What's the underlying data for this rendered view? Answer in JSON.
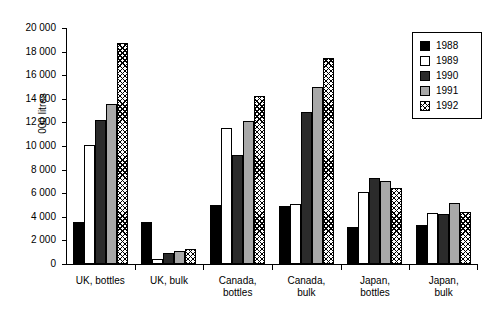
{
  "chart_data": {
    "type": "bar",
    "title": "",
    "xlabel": "",
    "ylabel": "000 litres",
    "ylim": [
      0,
      20000
    ],
    "ytick_labels": [
      "20 000",
      "18 000",
      "16 000",
      "14 000",
      "12 000",
      "10 000",
      "8 000",
      "6 000",
      "4 000",
      "2 000",
      "0"
    ],
    "ytick_values": [
      20000,
      18000,
      16000,
      14000,
      12000,
      10000,
      8000,
      6000,
      4000,
      2000,
      0
    ],
    "grid": false,
    "legend_position": "top-right",
    "categories": [
      "UK, bottles",
      "UK, bulk",
      "Canada,\nbottles",
      "Canada,\nbulk",
      "Japan,\nbottles",
      "Japan,\nbulk"
    ],
    "series": [
      {
        "name": "1988",
        "color": "#000000",
        "pattern": "solid-black",
        "values": [
          3600,
          3600,
          5000,
          4900,
          3100,
          3300
        ]
      },
      {
        "name": "1989",
        "color": "#ffffff",
        "pattern": "solid-white",
        "values": [
          10100,
          400,
          11500,
          5100,
          6100,
          4300
        ]
      },
      {
        "name": "1990",
        "color": "#2b2b2b",
        "pattern": "solid-dark",
        "values": [
          12200,
          900,
          9200,
          12900,
          7300,
          4200
        ]
      },
      {
        "name": "1991",
        "color": "#a8a8a8",
        "pattern": "solid-gray",
        "values": [
          13600,
          1100,
          12100,
          15000,
          7000,
          5200
        ]
      },
      {
        "name": "1992",
        "color": "#ffffff",
        "pattern": "crosshatch",
        "values": [
          18700,
          1300,
          14200,
          17500,
          6400,
          4400
        ]
      }
    ]
  },
  "legend": {
    "items": [
      {
        "label": "1988"
      },
      {
        "label": "1989"
      },
      {
        "label": "1990"
      },
      {
        "label": "1991"
      },
      {
        "label": "1992"
      }
    ]
  }
}
